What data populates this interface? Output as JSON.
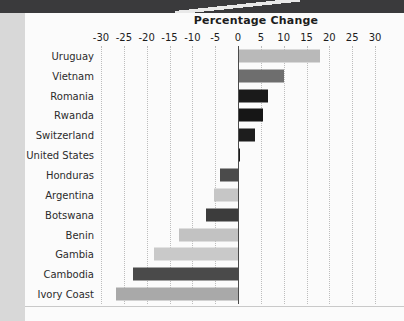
{
  "page": {
    "header_band": "dark-band",
    "background_color": "#fbfbfb",
    "left_margin_color": "#d8d8d8"
  },
  "chart_data": {
    "type": "bar",
    "orientation": "horizontal",
    "title": "Percentage Change",
    "xlabel": "",
    "ylabel": "",
    "xlim": [
      -30,
      30
    ],
    "grid": true,
    "legend": "none",
    "xticks": [
      -30,
      -25,
      -20,
      -15,
      -10,
      -5,
      0,
      5,
      10,
      15,
      20,
      25,
      30
    ],
    "xtick_labels": [
      "-30",
      "-25",
      "-20",
      "-15",
      "-10",
      "-5",
      "0",
      "5",
      "10",
      "15",
      "20",
      "25",
      "30"
    ],
    "categories": [
      "Uruguay",
      "Vietnam",
      "Romania",
      "Rwanda",
      "Switzerland",
      "United States",
      "Honduras",
      "Argentina",
      "Botswana",
      "Benin",
      "Gambia",
      "Cambodia",
      "Ivory Coast"
    ],
    "values": [
      18,
      10,
      6.5,
      5.5,
      3.8,
      0.5,
      -4,
      -5.3,
      -7,
      -13,
      -18.4,
      -23,
      -26.7
    ],
    "bar_colors": [
      "#b9b9b9",
      "#6e6e6e",
      "#1a1a1a",
      "#161616",
      "#1d1d1d",
      "#1a1a1a",
      "#4b4b4b",
      "#c6c6c6",
      "#3c3c3c",
      "#c2c2c2",
      "#c9c9c9",
      "#4a4a4a",
      "#a9a9a9"
    ]
  }
}
